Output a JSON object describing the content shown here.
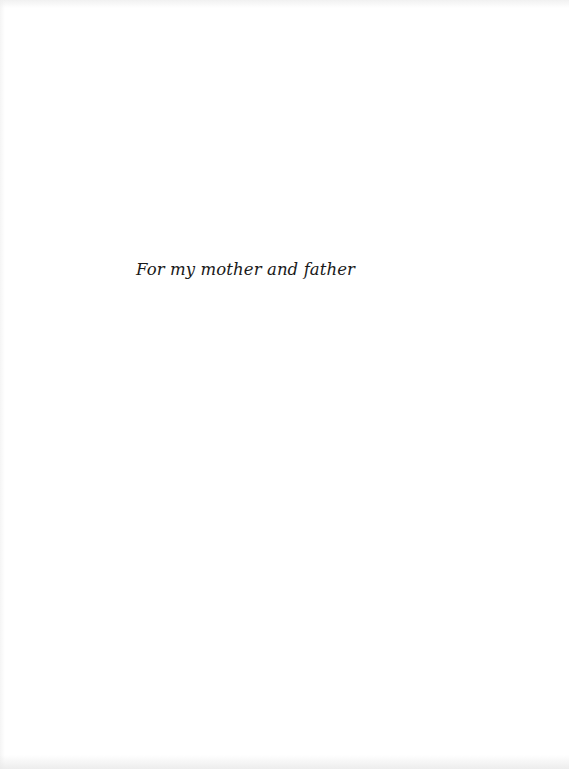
{
  "page": {
    "type": "dedication",
    "background_color": "#ffffff",
    "text_color": "#1a1a1a"
  },
  "dedication": {
    "text": "For my mother and father"
  }
}
